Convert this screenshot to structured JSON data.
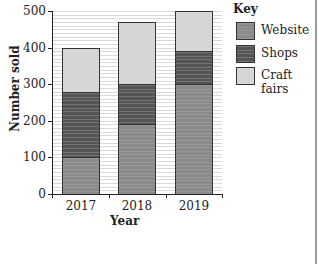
{
  "chart_data": {
    "type": "bar",
    "stacked": true,
    "title": "",
    "xlabel": "Year",
    "ylabel": "Number sold",
    "categories": [
      "2017",
      "2018",
      "2019"
    ],
    "series": [
      {
        "name": "Website",
        "values": [
          100,
          190,
          300
        ],
        "color": "#8a8a8a"
      },
      {
        "name": "Shops",
        "values": [
          180,
          110,
          90
        ],
        "color": "#555555"
      },
      {
        "name": "Craft fairs",
        "values": [
          120,
          170,
          110
        ],
        "color": "#d6d6d6"
      }
    ],
    "totals": [
      400,
      470,
      500
    ],
    "ylim": [
      0,
      500
    ],
    "yticks": [
      "0",
      "100",
      "200",
      "300",
      "400",
      "500"
    ],
    "grid": true,
    "legend_title": "Key",
    "legend_position": "right"
  }
}
